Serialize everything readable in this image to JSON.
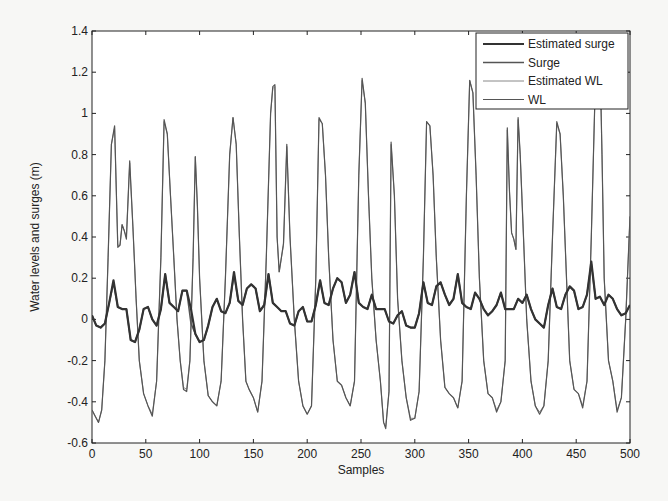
{
  "chart_data": {
    "type": "line",
    "title": "",
    "xlabel": "Samples",
    "ylabel": "Water levels and surges (m)",
    "xlim": [
      0,
      500
    ],
    "ylim": [
      -0.6,
      1.4
    ],
    "xticks": [
      0,
      50,
      100,
      150,
      200,
      250,
      300,
      350,
      400,
      450,
      500
    ],
    "yticks": [
      -0.6,
      -0.4,
      -0.2,
      0,
      0.2,
      0.4,
      0.6,
      0.8,
      1,
      1.2,
      1.4
    ],
    "ytick_labels": [
      "-0.6",
      "-0.4",
      "-0.2",
      "0",
      "0.2",
      "0.4",
      "0.6",
      "0.8",
      "1",
      "1.2",
      "1.4"
    ],
    "grid": false,
    "legend_position": "upper right",
    "legend": [
      "Estimated surge",
      "Surge",
      "Estimated WL",
      "WL"
    ],
    "series": [
      {
        "name": "Estimated surge",
        "x": [
          0,
          4,
          8,
          12,
          16,
          20,
          24,
          28,
          32,
          36,
          40,
          44,
          48,
          52,
          56,
          60,
          64,
          68,
          72,
          76,
          80,
          84,
          88,
          92,
          96,
          100,
          104,
          108,
          112,
          116,
          120,
          124,
          128,
          132,
          136,
          140,
          144,
          148,
          152,
          156,
          160,
          164,
          168,
          172,
          176,
          180,
          184,
          188,
          192,
          196,
          200,
          204,
          208,
          212,
          216,
          220,
          224,
          228,
          232,
          236,
          240,
          244,
          248,
          252,
          256,
          260,
          264,
          268,
          272,
          276,
          280,
          284,
          288,
          292,
          296,
          300,
          304,
          308,
          312,
          316,
          320,
          324,
          328,
          332,
          336,
          340,
          344,
          348,
          352,
          356,
          360,
          364,
          368,
          372,
          376,
          380,
          384,
          388,
          392,
          396,
          400,
          404,
          408,
          412,
          416,
          420,
          424,
          428,
          432,
          436,
          440,
          444,
          448,
          452,
          456,
          460,
          464,
          468,
          472,
          476,
          480,
          484,
          488,
          492,
          496,
          500
        ],
        "values": [
          0.02,
          -0.03,
          -0.04,
          -0.02,
          0.08,
          0.19,
          0.06,
          0.05,
          0.05,
          -0.1,
          -0.11,
          -0.05,
          0.05,
          0.06,
          0.0,
          -0.03,
          0.05,
          0.22,
          0.08,
          0.06,
          0.04,
          0.14,
          0.14,
          0.05,
          -0.07,
          -0.11,
          -0.1,
          -0.03,
          0.06,
          0.1,
          0.04,
          0.03,
          0.08,
          0.23,
          0.09,
          0.07,
          0.15,
          0.17,
          0.15,
          0.04,
          0.07,
          0.22,
          0.08,
          0.06,
          0.04,
          0.04,
          -0.02,
          -0.03,
          0.04,
          0.06,
          -0.01,
          -0.01,
          0.07,
          0.19,
          0.08,
          0.07,
          0.15,
          0.2,
          0.18,
          0.08,
          0.12,
          0.23,
          0.08,
          0.06,
          0.05,
          0.12,
          0.05,
          0.05,
          0.05,
          -0.01,
          -0.02,
          0.02,
          0.04,
          -0.03,
          -0.04,
          -0.04,
          0.03,
          0.18,
          0.08,
          0.07,
          0.16,
          0.18,
          0.12,
          0.07,
          0.1,
          0.22,
          0.08,
          0.06,
          0.05,
          0.13,
          0.1,
          0.05,
          0.02,
          0.04,
          0.07,
          0.13,
          0.05,
          0.05,
          0.05,
          0.1,
          0.08,
          0.12,
          0.05,
          0.0,
          -0.02,
          -0.04,
          0.07,
          0.15,
          0.06,
          0.05,
          0.12,
          0.16,
          0.14,
          0.05,
          0.06,
          0.12,
          0.28,
          0.1,
          0.11,
          0.07,
          0.12,
          0.1,
          0.05,
          0.02,
          0.03,
          0.07
        ]
      },
      {
        "name": "Surge",
        "x": [
          0,
          4,
          8,
          12,
          16,
          20,
          24,
          28,
          32,
          36,
          40,
          44,
          48,
          52,
          56,
          60,
          64,
          68,
          72,
          76,
          80,
          84,
          88,
          92,
          96,
          100,
          104,
          108,
          112,
          116,
          120,
          124,
          128,
          132,
          136,
          140,
          144,
          148,
          152,
          156,
          160,
          164,
          168,
          172,
          176,
          180,
          184,
          188,
          192,
          196,
          200,
          204,
          208,
          212,
          216,
          220,
          224,
          228,
          232,
          236,
          240,
          244,
          248,
          252,
          256,
          260,
          264,
          268,
          272,
          276,
          280,
          284,
          288,
          292,
          296,
          300,
          304,
          308,
          312,
          316,
          320,
          324,
          328,
          332,
          336,
          340,
          344,
          348,
          352,
          356,
          360,
          364,
          368,
          372,
          376,
          380,
          384,
          388,
          392,
          396,
          400,
          404,
          408,
          412,
          416,
          420,
          424,
          428,
          432,
          436,
          440,
          444,
          448,
          452,
          456,
          460,
          464,
          468,
          472,
          476,
          480,
          484,
          488,
          492,
          496,
          500
        ],
        "values": [
          0.02,
          -0.03,
          -0.04,
          -0.02,
          0.08,
          0.18,
          0.06,
          0.05,
          0.05,
          -0.1,
          -0.11,
          -0.05,
          0.05,
          0.06,
          0.0,
          -0.03,
          0.05,
          0.22,
          0.08,
          0.06,
          0.04,
          0.14,
          0.14,
          -0.02,
          -0.07,
          -0.11,
          -0.1,
          -0.03,
          0.06,
          0.1,
          0.04,
          0.03,
          0.08,
          0.22,
          0.09,
          0.07,
          0.15,
          0.17,
          0.15,
          0.04,
          0.07,
          0.22,
          0.08,
          0.06,
          0.04,
          0.04,
          -0.02,
          -0.03,
          0.04,
          0.06,
          -0.01,
          -0.01,
          0.07,
          0.19,
          0.08,
          0.07,
          0.15,
          0.2,
          0.18,
          0.08,
          0.12,
          0.23,
          0.08,
          0.06,
          0.05,
          0.12,
          0.05,
          0.05,
          0.05,
          -0.01,
          -0.02,
          0.02,
          0.04,
          -0.03,
          -0.04,
          -0.04,
          0.03,
          0.18,
          0.08,
          0.07,
          0.16,
          0.18,
          0.12,
          0.07,
          0.1,
          0.22,
          0.08,
          0.06,
          0.05,
          0.13,
          0.1,
          0.05,
          0.02,
          0.04,
          0.07,
          0.13,
          0.05,
          0.05,
          0.05,
          0.1,
          0.08,
          0.12,
          0.05,
          0.0,
          -0.02,
          -0.04,
          0.07,
          0.15,
          0.06,
          0.05,
          0.12,
          0.16,
          0.14,
          0.05,
          0.06,
          0.12,
          0.27,
          0.1,
          0.11,
          0.07,
          0.12,
          0.1,
          0.05,
          0.02,
          0.03,
          0.07
        ]
      },
      {
        "name": "Estimated WL",
        "x": [
          0,
          3,
          6,
          9,
          12,
          15,
          18,
          21,
          24,
          26,
          28,
          30,
          32,
          35,
          38,
          41,
          44,
          48,
          52,
          56,
          60,
          64,
          67,
          70,
          73,
          76,
          79,
          82,
          85,
          88,
          91,
          94,
          96,
          98,
          100,
          104,
          108,
          112,
          116,
          120,
          124,
          128,
          131,
          134,
          137,
          140,
          143,
          146,
          150,
          154,
          158,
          162,
          166,
          168,
          170,
          172,
          174,
          176,
          178,
          181,
          184,
          188,
          192,
          196,
          200,
          204,
          208,
          211,
          214,
          217,
          220,
          224,
          228,
          232,
          236,
          240,
          244,
          248,
          251,
          254,
          257,
          260,
          264,
          268,
          271,
          273,
          276,
          278,
          281,
          284,
          288,
          292,
          296,
          300,
          304,
          308,
          311,
          314,
          317,
          320,
          324,
          328,
          332,
          336,
          340,
          344,
          348,
          351,
          354,
          357,
          360,
          364,
          368,
          372,
          376,
          380,
          384,
          386,
          388,
          390,
          392,
          394,
          396,
          398,
          401,
          404,
          408,
          412,
          416,
          420,
          424,
          428,
          432,
          435,
          438,
          441,
          444,
          448,
          452,
          456,
          460,
          464,
          468,
          472,
          474,
          476,
          480,
          484,
          488,
          492,
          496,
          500
        ],
        "values": [
          -0.44,
          -0.47,
          -0.5,
          -0.44,
          -0.2,
          0.3,
          0.85,
          0.93,
          0.36,
          0.36,
          0.46,
          0.43,
          0.4,
          0.76,
          0.45,
          0.1,
          -0.2,
          -0.36,
          -0.42,
          -0.46,
          -0.3,
          0.3,
          0.96,
          0.9,
          0.6,
          0.3,
          0.0,
          -0.2,
          -0.33,
          -0.34,
          -0.2,
          0.3,
          0.79,
          0.55,
          0.2,
          -0.2,
          -0.37,
          -0.4,
          -0.42,
          -0.3,
          0.2,
          0.8,
          0.98,
          0.85,
          0.4,
          0.0,
          -0.3,
          -0.34,
          -0.38,
          -0.45,
          -0.3,
          0.3,
          1.0,
          1.12,
          1.13,
          0.4,
          0.23,
          0.3,
          0.36,
          0.84,
          0.4,
          0.0,
          -0.3,
          -0.42,
          -0.46,
          -0.42,
          0.2,
          0.97,
          0.95,
          0.7,
          0.3,
          -0.1,
          -0.3,
          -0.32,
          -0.38,
          -0.42,
          -0.3,
          0.7,
          1.16,
          1.05,
          0.6,
          0.2,
          -0.1,
          -0.3,
          -0.5,
          -0.52,
          -0.35,
          0.85,
          0.6,
          0.1,
          -0.2,
          -0.38,
          -0.48,
          -0.48,
          -0.35,
          0.3,
          0.96,
          0.94,
          0.7,
          0.3,
          -0.1,
          -0.33,
          -0.36,
          -0.38,
          -0.43,
          -0.3,
          0.6,
          1.16,
          1.1,
          0.7,
          0.2,
          -0.2,
          -0.36,
          -0.38,
          -0.44,
          -0.4,
          -0.2,
          0.92,
          0.62,
          0.42,
          0.39,
          0.34,
          0.97,
          0.8,
          0.4,
          0.0,
          -0.3,
          -0.42,
          -0.45,
          -0.42,
          -0.2,
          0.4,
          0.95,
          0.9,
          0.6,
          0.2,
          -0.2,
          -0.34,
          -0.36,
          -0.42,
          -0.3,
          0.4,
          1.2,
          1.3,
          0.8,
          0.2,
          -0.2,
          -0.3,
          -0.44,
          -0.38,
          0.0,
          0.5
        ]
      },
      {
        "name": "WL",
        "x": [
          0,
          3,
          6,
          9,
          12,
          15,
          18,
          21,
          24,
          26,
          28,
          30,
          32,
          35,
          38,
          41,
          44,
          48,
          52,
          56,
          60,
          64,
          67,
          70,
          73,
          76,
          79,
          82,
          85,
          88,
          91,
          94,
          96,
          98,
          100,
          104,
          108,
          112,
          116,
          120,
          124,
          128,
          131,
          134,
          137,
          140,
          143,
          146,
          150,
          154,
          158,
          162,
          166,
          168,
          170,
          172,
          174,
          176,
          178,
          181,
          184,
          188,
          192,
          196,
          200,
          204,
          208,
          211,
          214,
          217,
          220,
          224,
          228,
          232,
          236,
          240,
          244,
          248,
          251,
          254,
          257,
          260,
          264,
          268,
          271,
          273,
          276,
          278,
          281,
          284,
          288,
          292,
          296,
          300,
          304,
          308,
          311,
          314,
          317,
          320,
          324,
          328,
          332,
          336,
          340,
          344,
          348,
          351,
          354,
          357,
          360,
          364,
          368,
          372,
          376,
          380,
          384,
          386,
          388,
          390,
          392,
          394,
          396,
          398,
          401,
          404,
          408,
          412,
          416,
          420,
          424,
          428,
          432,
          435,
          438,
          441,
          444,
          448,
          452,
          456,
          460,
          464,
          468,
          472,
          474,
          476,
          480,
          484,
          488,
          492,
          496,
          500
        ],
        "values": [
          -0.44,
          -0.47,
          -0.5,
          -0.44,
          -0.2,
          0.3,
          0.85,
          0.94,
          0.35,
          0.36,
          0.46,
          0.43,
          0.39,
          0.77,
          0.45,
          0.1,
          -0.2,
          -0.36,
          -0.42,
          -0.47,
          -0.3,
          0.3,
          0.97,
          0.9,
          0.6,
          0.3,
          0.0,
          -0.2,
          -0.34,
          -0.35,
          -0.2,
          0.3,
          0.79,
          0.55,
          0.2,
          -0.2,
          -0.37,
          -0.4,
          -0.42,
          -0.3,
          0.2,
          0.8,
          0.98,
          0.85,
          0.4,
          0.0,
          -0.3,
          -0.34,
          -0.38,
          -0.45,
          -0.3,
          0.3,
          1.0,
          1.13,
          1.14,
          0.4,
          0.23,
          0.3,
          0.37,
          0.85,
          0.4,
          0.0,
          -0.3,
          -0.42,
          -0.46,
          -0.42,
          0.2,
          0.98,
          0.95,
          0.7,
          0.3,
          -0.1,
          -0.3,
          -0.32,
          -0.38,
          -0.42,
          -0.3,
          0.7,
          1.17,
          1.05,
          0.6,
          0.2,
          -0.1,
          -0.3,
          -0.5,
          -0.53,
          -0.35,
          0.86,
          0.6,
          0.1,
          -0.2,
          -0.38,
          -0.49,
          -0.48,
          -0.35,
          0.3,
          0.96,
          0.94,
          0.7,
          0.3,
          -0.1,
          -0.33,
          -0.36,
          -0.38,
          -0.43,
          -0.3,
          0.6,
          1.16,
          1.1,
          0.7,
          0.2,
          -0.2,
          -0.36,
          -0.38,
          -0.45,
          -0.4,
          -0.2,
          0.93,
          0.62,
          0.42,
          0.39,
          0.34,
          0.98,
          0.8,
          0.4,
          0.0,
          -0.3,
          -0.42,
          -0.46,
          -0.42,
          -0.2,
          0.4,
          0.96,
          0.9,
          0.6,
          0.2,
          -0.2,
          -0.34,
          -0.36,
          -0.43,
          -0.3,
          0.4,
          1.2,
          1.3,
          0.8,
          0.2,
          -0.2,
          -0.3,
          -0.45,
          -0.38,
          0.0,
          0.5
        ]
      }
    ]
  },
  "legend": {
    "items": [
      {
        "label": "Estimated surge",
        "color": "#333333",
        "width": 2.2
      },
      {
        "label": "Surge",
        "color": "#555555",
        "width": 1.6
      },
      {
        "label": "Estimated WL",
        "color": "#888888",
        "width": 1.0
      },
      {
        "label": "WL",
        "color": "#555555",
        "width": 1.2
      }
    ]
  },
  "colors": {
    "background": "#f7f7f5",
    "plot_background": "#ffffff",
    "axis": "#222222"
  }
}
